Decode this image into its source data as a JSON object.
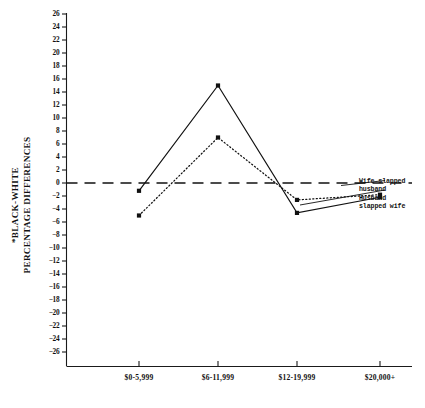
{
  "chart_data": {
    "type": "line",
    "title": "",
    "xlabel": "",
    "ylabel": "*BLACK-WHITE PERCENTAGE DIFFERENCES",
    "ylabel_line1": "*BLACK-WHITE",
    "ylabel_line2": "PERCENTAGE DIFFERENCES",
    "categories": [
      "$0-5,999",
      "$6-11,999",
      "$12-19,999",
      "$20,000+"
    ],
    "series": [
      {
        "name": "Wife slapped husband",
        "style": "dotted",
        "values": [
          -5.0,
          7.0,
          -2.6,
          -1.8
        ]
      },
      {
        "name": "Husband slapped wife",
        "style": "solid",
        "values": [
          -1.2,
          15.0,
          -4.6,
          -2.2
        ]
      }
    ],
    "reference_line": {
      "value": 0,
      "style": "dashed"
    },
    "ylim": [
      -26,
      26
    ],
    "ytick_step": 2,
    "ytick_labels": [
      "26",
      "24",
      "22",
      "20",
      "18",
      "16",
      "14",
      "12",
      "10",
      "8",
      "6",
      "4",
      "2",
      "0",
      "-2",
      "-4",
      "-6",
      "-8",
      "-10",
      "-12",
      "-14",
      "-16",
      "-18",
      "-20",
      "-22",
      "-24",
      "-26"
    ],
    "grid": false,
    "legend_position": "right-inline"
  },
  "legend": {
    "entries": [
      {
        "line1": "Wife slapped",
        "line2": "husband"
      },
      {
        "line1": "Husband",
        "line2": "slapped wife"
      }
    ]
  },
  "colors": {
    "ink": "#111111",
    "background": "#ffffff"
  }
}
